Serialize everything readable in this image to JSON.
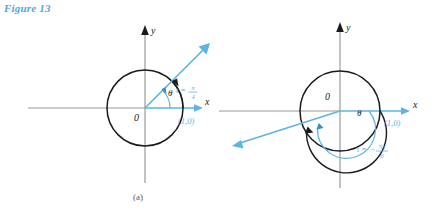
{
  "figure": {
    "title": "Figure 13"
  },
  "panels": [
    {
      "caption": "(a)",
      "axis_x_label": "x",
      "axis_y_label": "y",
      "origin_label": "0",
      "angle_label": "θ",
      "point_label": "(1,0)",
      "t_label_prefix": "t =",
      "t_numerator": "π",
      "t_denominator": "4",
      "t_sign": "",
      "angle_degrees": 45,
      "rotation": "counterclockwise"
    },
    {
      "caption": "(b)",
      "axis_x_label": "x",
      "axis_y_label": "y",
      "origin_label": "0",
      "angle_label": "θ",
      "point_label": "(1,0)",
      "t_label_prefix": "t =",
      "t_numerator": "5π",
      "t_denominator": "6",
      "t_sign": "−",
      "angle_degrees": -150,
      "rotation": "clockwise"
    }
  ],
  "colors": {
    "accent_blue": "#5cb3e4",
    "title_blue": "#4ea6dd",
    "circle_black": "#1a1a1a",
    "axis_gray": "#9a9a9a",
    "caption_gray": "#5b5b5b"
  }
}
